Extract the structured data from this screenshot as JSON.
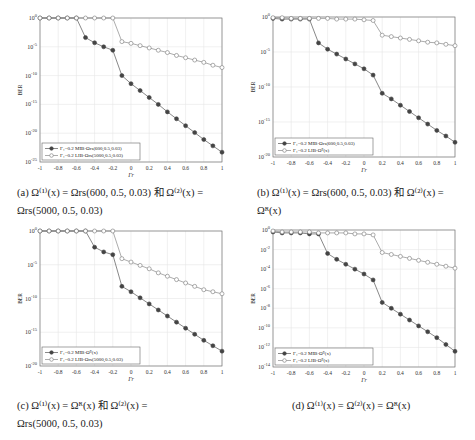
{
  "figure": {
    "panels": [
      {
        "id": "a",
        "caption_lines": [
          "(a)   Ω⁽¹⁾(x)  =  Ωrs(600, 0.5, 0.03)  和  Ω⁽²⁾(x)  =",
          "Ωrs(5000, 0.5, 0.03)"
        ],
        "legend": [
          "Γ₁=0.2 MIB-Ωrs(600,0.5,0.03)",
          "Γ₁=0.2 LIB-Ωrs(5000,0.5,0.03)"
        ]
      },
      {
        "id": "b",
        "caption_lines": [
          "(b)   Ω⁽¹⁾(x)  =  Ωrs(600, 0.5, 0.03)  和  Ω⁽²⁾(x)  =",
          "Ωᴿ(x)"
        ],
        "legend": [
          "Γ₁=0.2 MIB-Ωrs(600,0.5,0.03)",
          "Γ₁=0.2 LIB-Ωᴿ(x)"
        ]
      },
      {
        "id": "c",
        "caption_lines": [
          "(c)      Ω⁽¹⁾(x)      =      Ωᴿ(x)   和   Ω⁽²⁾(x)      =",
          "Ωrs(5000, 0.5, 0.03)"
        ],
        "legend": [
          "Γ₁=0.2 MIB-Ωᴿ(x)",
          "Γ₁=0.2 LIB-Ωrs(5000,0.5,0.03)"
        ]
      },
      {
        "id": "d",
        "caption_lines": [
          "(d)  Ω⁽¹⁾(x) = Ω⁽²⁾(x) = Ωᴿ(x)"
        ],
        "legend": [
          "Γ₁=0.2 MIB-Ωᴿ(x)",
          "Γ₁=0.2 LIB-Ωᴿ(x)"
        ]
      }
    ]
  },
  "chart_data": [
    {
      "type": "line",
      "title": "(a)",
      "xlabel": "Γr",
      "ylabel": "BER",
      "yscale": "log",
      "x": [
        -1,
        -0.9,
        -0.8,
        -0.7,
        -0.6,
        -0.5,
        -0.4,
        -0.3,
        -0.2,
        -0.1,
        0,
        0.1,
        0.2,
        0.3,
        0.4,
        0.5,
        0.6,
        0.7,
        0.8,
        0.9,
        1
      ],
      "xticks": [
        -1,
        -0.8,
        -0.6,
        -0.4,
        -0.2,
        0,
        0.2,
        0.4,
        0.6,
        0.8,
        1
      ],
      "xtick_labels": [
        "-1",
        "-0.8",
        "-0.6",
        "-0.4",
        "-0.2",
        "0",
        "0.2",
        "0.4",
        "0.6",
        "0.8",
        "1"
      ],
      "ylim_log10": [
        -25,
        0
      ],
      "yticks_log10": [
        0,
        -5,
        -10,
        -15,
        -20,
        -25
      ],
      "ytick_labels": [
        "10^0",
        "10^-5",
        "10^-10",
        "10^-15",
        "10^-20",
        "10^-25"
      ],
      "grid": true,
      "legend_position": "lower left",
      "series": [
        {
          "name": "Γ1=0.2 MIB-Ωrs(600,0.5,0.03)",
          "marker": "filled",
          "log10_values": [
            0,
            0,
            0,
            0,
            0,
            -3.4,
            -4.3,
            -5.0,
            -5.6,
            -10.0,
            -11.4,
            -12.6,
            -13.8,
            -15.0,
            -16.3,
            -17.5,
            -18.7,
            -19.9,
            -21.1,
            -22.2,
            -23.3
          ]
        },
        {
          "name": "Γ1=0.2 LIB-Ωrs(5000,0.5,0.03)",
          "marker": "open",
          "log10_values": [
            0,
            0,
            0,
            0,
            0,
            0,
            0,
            0,
            0,
            -4.1,
            -4.4,
            -4.8,
            -5.2,
            -5.6,
            -6.0,
            -6.5,
            -6.9,
            -7.3,
            -7.7,
            -8.2,
            -8.6
          ]
        }
      ]
    },
    {
      "type": "line",
      "title": "(b)",
      "xlabel": "Γr",
      "ylabel": "BER",
      "yscale": "log",
      "x": [
        -1,
        -0.9,
        -0.8,
        -0.7,
        -0.6,
        -0.5,
        -0.4,
        -0.3,
        -0.2,
        -0.1,
        0,
        0.1,
        0.2,
        0.3,
        0.4,
        0.5,
        0.6,
        0.7,
        0.8,
        0.9,
        1
      ],
      "xticks": [
        -1,
        -0.8,
        -0.6,
        -0.4,
        -0.2,
        0,
        0.2,
        0.4,
        0.6,
        0.8,
        1
      ],
      "xtick_labels": [
        "-1",
        "-0.8",
        "-0.6",
        "-0.4",
        "-0.2",
        "0",
        "0.2",
        "0.4",
        "0.6",
        "0.8",
        "1"
      ],
      "ylim_log10": [
        -20,
        0
      ],
      "yticks_log10": [
        0,
        -5,
        -10,
        -15,
        -20
      ],
      "ytick_labels": [
        "10^0",
        "10^-5",
        "10^-10",
        "10^-15",
        "10^-20"
      ],
      "grid": true,
      "legend_position": "lower left",
      "series": [
        {
          "name": "Γ1=0.2 MIB-Ωrs(600,0.5,0.03)",
          "marker": "filled",
          "log10_values": [
            -0.2,
            -0.3,
            -0.3,
            -0.3,
            -0.3,
            -3.7,
            -4.6,
            -5.3,
            -6.0,
            -6.7,
            -7.4,
            -8.3,
            -10.9,
            -11.7,
            -12.6,
            -13.5,
            -14.4,
            -15.3,
            -16.2,
            -17.0,
            -17.9
          ]
        },
        {
          "name": "Γ1=0.2 LIB-Ωᴿ(x)",
          "marker": "open",
          "log10_values": [
            -0.1,
            -0.1,
            -0.2,
            -0.2,
            -0.2,
            -0.2,
            -0.2,
            -0.3,
            -0.3,
            -0.3,
            -0.4,
            -0.5,
            -2.6,
            -2.8,
            -3.0,
            -3.2,
            -3.4,
            -3.6,
            -3.7,
            -3.9,
            -4.1
          ]
        }
      ]
    },
    {
      "type": "line",
      "title": "(c)",
      "xlabel": "Γr",
      "ylabel": "BER",
      "yscale": "log",
      "x": [
        -1,
        -0.9,
        -0.8,
        -0.7,
        -0.6,
        -0.5,
        -0.4,
        -0.3,
        -0.2,
        -0.1,
        0,
        0.1,
        0.2,
        0.3,
        0.4,
        0.5,
        0.6,
        0.7,
        0.8,
        0.9,
        1
      ],
      "xticks": [
        -1,
        -0.8,
        -0.6,
        -0.4,
        -0.2,
        0,
        0.2,
        0.4,
        0.6,
        0.8,
        1
      ],
      "xtick_labels": [
        "-1",
        "-0.8",
        "-0.6",
        "-0.4",
        "-0.2",
        "0",
        "0.2",
        "0.4",
        "0.6",
        "0.8",
        "1"
      ],
      "ylim_log10": [
        -20,
        0
      ],
      "yticks_log10": [
        0,
        -5,
        -10,
        -15,
        -20
      ],
      "ytick_labels": [
        "10^0",
        "10^-5",
        "10^-10",
        "10^-15",
        "10^-20"
      ],
      "grid": true,
      "legend_position": "lower left",
      "series": [
        {
          "name": "Γ1=0.2 MIB-Ωᴿ(x)",
          "marker": "filled",
          "log10_values": [
            0,
            0,
            0,
            0,
            0,
            0,
            -2.4,
            -3.1,
            -3.5,
            -8.2,
            -9.0,
            -9.9,
            -10.8,
            -11.7,
            -12.6,
            -13.5,
            -14.4,
            -15.3,
            -16.2,
            -17.0,
            -17.8
          ]
        },
        {
          "name": "Γ1=0.2 LIB-Ωrs(5000,0.5,0.03)",
          "marker": "open",
          "log10_values": [
            0,
            0,
            0,
            0,
            0,
            0,
            0,
            0,
            0,
            -4.1,
            -4.6,
            -5.1,
            -5.6,
            -6.2,
            -6.7,
            -7.2,
            -7.7,
            -8.2,
            -8.7,
            -9.0,
            -9.3
          ]
        }
      ]
    },
    {
      "type": "line",
      "title": "(d)",
      "xlabel": "Γr",
      "ylabel": "BER",
      "yscale": "log",
      "x": [
        -1,
        -0.9,
        -0.8,
        -0.7,
        -0.6,
        -0.5,
        -0.4,
        -0.3,
        -0.2,
        -0.1,
        0,
        0.1,
        0.2,
        0.3,
        0.4,
        0.5,
        0.6,
        0.7,
        0.8,
        0.9,
        1
      ],
      "xticks": [
        -1,
        -0.8,
        -0.6,
        -0.4,
        -0.2,
        0,
        0.2,
        0.4,
        0.6,
        0.8,
        1
      ],
      "xtick_labels": [
        "-1",
        "-0.8",
        "-0.6",
        "-0.4",
        "-0.2",
        "0",
        "0.2",
        "0.4",
        "0.6",
        "0.8",
        "1"
      ],
      "ylim_log10": [
        -14,
        0
      ],
      "yticks_log10": [
        0,
        -2,
        -4,
        -6,
        -8,
        -10,
        -12,
        -14
      ],
      "ytick_labels": [
        "10^0",
        "10^-2",
        "10^-4",
        "10^-6",
        "10^-8",
        "10^-10",
        "10^-12",
        "10^-14"
      ],
      "grid": true,
      "legend_position": "lower left",
      "series": [
        {
          "name": "Γ1=0.2 MIB-Ωᴿ(x)",
          "marker": "filled",
          "log10_values": [
            -0.2,
            -0.3,
            -0.3,
            -0.3,
            -0.4,
            -0.4,
            -2.4,
            -3.0,
            -3.5,
            -4.0,
            -4.5,
            -5.1,
            -7.4,
            -8.0,
            -8.6,
            -9.2,
            -9.8,
            -10.4,
            -11.0,
            -11.7,
            -12.4
          ]
        },
        {
          "name": "Γ1=0.2 LIB-Ωᴿ(x)",
          "marker": "open",
          "log10_values": [
            -0.1,
            -0.2,
            -0.2,
            -0.2,
            -0.2,
            -0.3,
            -0.3,
            -0.3,
            -0.3,
            -0.4,
            -0.4,
            -0.5,
            -2.3,
            -2.5,
            -2.7,
            -2.9,
            -3.1,
            -3.3,
            -3.5,
            -3.7,
            -3.9
          ]
        }
      ]
    }
  ]
}
